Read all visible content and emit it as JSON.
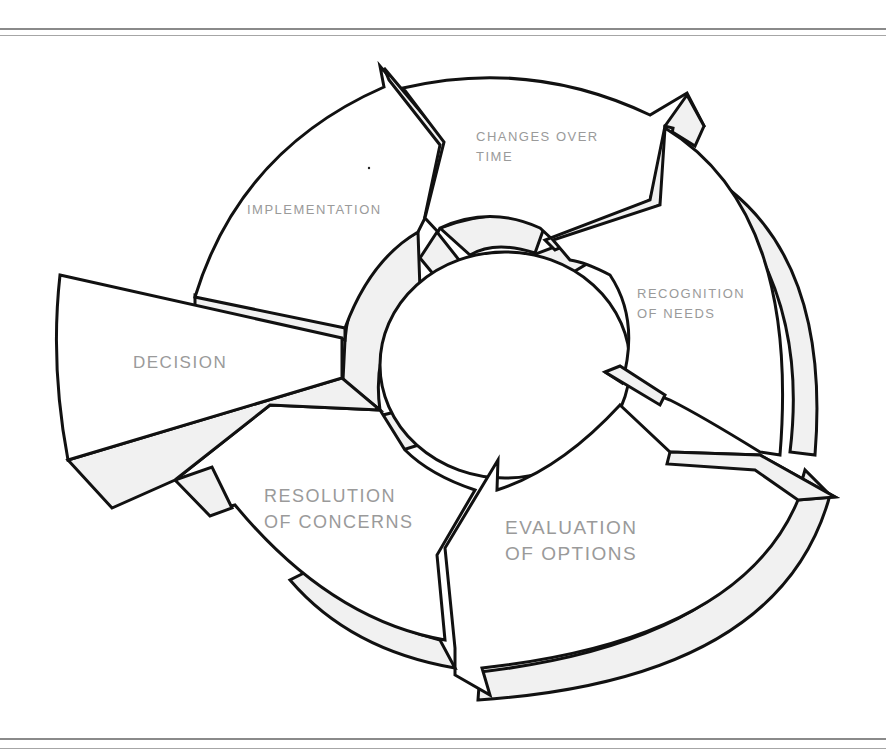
{
  "diagram": {
    "type": "cycle",
    "center": {
      "x": 505,
      "y": 365
    },
    "stages": [
      {
        "id": "changes",
        "lines": [
          "CHANGES OVER",
          "TIME"
        ]
      },
      {
        "id": "recognition",
        "lines": [
          "RECOGNITION",
          "OF NEEDS"
        ]
      },
      {
        "id": "evaluation",
        "lines": [
          "EVALUATION",
          "OF OPTIONS"
        ]
      },
      {
        "id": "resolution",
        "lines": [
          "RESOLUTION",
          "OF CONCERNS"
        ]
      },
      {
        "id": "decision",
        "lines": [
          "DECISION"
        ]
      },
      {
        "id": "implementation",
        "lines": [
          "IMPLEMENTATION"
        ]
      }
    ],
    "colors": {
      "stroke": "#111111",
      "fill": "#ffffff",
      "shade": "#f1f1f1",
      "label": "#9a9a9a",
      "rule": "#8a8a8a"
    }
  }
}
